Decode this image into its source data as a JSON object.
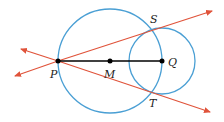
{
  "diagram": {
    "type": "geometry",
    "colors": {
      "circle": "#4a9fd4",
      "tangent_line": "#e0533a",
      "segment": "#000000",
      "point": "#000000"
    },
    "points": {
      "P": {
        "label": "P",
        "x": 58,
        "y": 61
      },
      "M": {
        "label": "M",
        "x": 110,
        "y": 61
      },
      "Q": {
        "label": "Q",
        "x": 162,
        "y": 61
      },
      "S": {
        "label": "S",
        "x": 152,
        "y": 29
      },
      "T": {
        "label": "T",
        "x": 152,
        "y": 93
      }
    },
    "circles": [
      {
        "name": "circle-M",
        "center": "M",
        "radius": 52
      },
      {
        "name": "circle-Q",
        "center": "Q",
        "radius": 33
      }
    ],
    "segments": [
      {
        "name": "segment-PQ",
        "from": "P",
        "to": "Q"
      }
    ],
    "lines": [
      {
        "name": "line-PS",
        "through": [
          "P",
          "S"
        ],
        "arrows": "both"
      },
      {
        "name": "line-PT",
        "through": [
          "P",
          "T"
        ],
        "arrows": "both"
      }
    ],
    "labels": {
      "P": "P",
      "M": "M",
      "Q": "Q",
      "S": "S",
      "T": "T"
    }
  }
}
